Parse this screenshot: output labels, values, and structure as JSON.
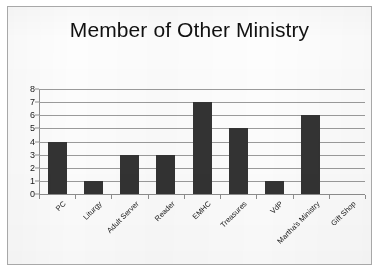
{
  "chart_data": {
    "type": "bar",
    "title": "Member of Other Ministry",
    "xlabel": "",
    "ylabel": "",
    "categories": [
      "PC",
      "Liturgy",
      "Adult Server",
      "Reader",
      "EMHC",
      "Treasures",
      "VdP",
      "Martha's Ministry",
      "Gift Shop"
    ],
    "values": [
      4,
      1,
      3,
      3,
      7,
      5,
      1,
      6,
      0
    ],
    "ylim": [
      0,
      8
    ],
    "yticks": [
      0,
      1,
      2,
      3,
      4,
      5,
      6,
      7,
      8
    ],
    "ytick_labels": [
      "0",
      "1",
      "2",
      "3",
      "4",
      "5",
      "6",
      "7",
      "8"
    ],
    "grid": true,
    "legend": false,
    "legend_position": "none",
    "bar_color": "#333333",
    "grid_color": "#9b9b9b",
    "axis_color": "#8d8d8d",
    "title_color": "#111111",
    "label_rotation": -45
  }
}
